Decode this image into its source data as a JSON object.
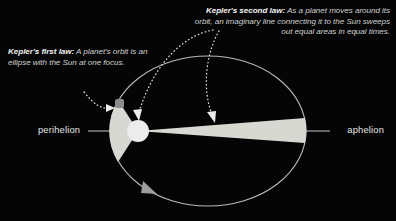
{
  "figure": {
    "title_alt": "Kepler's laws of planetary motion diagram",
    "background_color": "#050505",
    "text_color": "#cfcfcf",
    "orbit_color": "#b8b8b8",
    "sun_color": "#ececec",
    "sector_color": "#d6d6d1",
    "planet_color": "#8a8a8a",
    "axis_color": "#cccccc",
    "dotted_color": "#e0e0e0"
  },
  "callouts": {
    "first_law": {
      "name": "Kepler's first law:",
      "body": " A planet's orbit is an ellipse with the Sun at one focus."
    },
    "second_law": {
      "name": "Kepler's second law:",
      "body": " As a planet moves around its orbit, an imaginary line connecting it to the Sun sweeps out equal areas in equal times."
    }
  },
  "axis_labels": {
    "perihelion": "perihelion",
    "aphelion": "aphelion"
  },
  "geometry": {
    "ellipse": {
      "cx": 208,
      "cy": 131,
      "rx": 98,
      "ry": 75
    },
    "sun": {
      "cx": 138,
      "cy": 131,
      "r": 11
    },
    "planet": {
      "cx": 120,
      "cy": 103,
      "size": 9
    },
    "major_axis": {
      "x1": 88,
      "y1": 131,
      "x2": 330,
      "y2": 131
    },
    "perihelion_sector": {
      "label": "equal area near perihelion"
    },
    "aphelion_sector": {
      "label": "equal area near aphelion"
    },
    "orbit_direction_arrow": {
      "x": 151,
      "y": 190,
      "direction": "clockwise"
    }
  }
}
